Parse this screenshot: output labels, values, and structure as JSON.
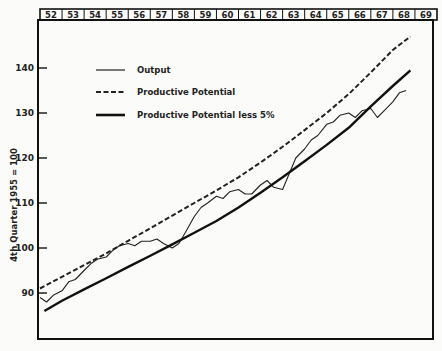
{
  "chart_data": {
    "type": "line",
    "title": "",
    "xlabel": "",
    "ylabel": "4th Quarter 1955 = 100",
    "ylim": [
      82,
      152
    ],
    "yticks": [
      90,
      100,
      110,
      120,
      130,
      140
    ],
    "x_header_years": [
      "52",
      "53",
      "54",
      "55",
      "56",
      "57",
      "58",
      "59",
      "60",
      "61",
      "62",
      "63",
      "64",
      "65",
      "66",
      "67",
      "68",
      "69"
    ],
    "grid": false,
    "legend_position": "upper-left inside",
    "series": [
      {
        "name": "Output",
        "style": "thin solid",
        "x": [
          52.0,
          52.3,
          52.6,
          53.0,
          53.3,
          53.6,
          54.0,
          54.3,
          54.6,
          55.0,
          55.3,
          55.6,
          56.0,
          56.3,
          56.6,
          57.0,
          57.3,
          57.6,
          58.0,
          58.3,
          58.6,
          59.0,
          59.3,
          59.6,
          60.0,
          60.3,
          60.6,
          61.0,
          61.3,
          61.6,
          62.0,
          62.3,
          62.6,
          63.0,
          63.3,
          63.6,
          64.0,
          64.3,
          64.6,
          65.0,
          65.3,
          65.6,
          66.0,
          66.3,
          66.6,
          67.0,
          67.3,
          67.6,
          68.0,
          68.3,
          68.6
        ],
        "values": [
          89.0,
          88.0,
          89.5,
          90.5,
          92.5,
          93.0,
          95.0,
          96.5,
          97.5,
          98.0,
          99.5,
          100.5,
          101.0,
          100.5,
          101.5,
          101.5,
          102.0,
          101.0,
          100.0,
          101.0,
          103.5,
          107.0,
          109.0,
          110.0,
          111.5,
          111.0,
          112.5,
          113.0,
          112.0,
          112.0,
          114.0,
          115.0,
          113.5,
          113.0,
          116.5,
          120.0,
          122.0,
          124.0,
          125.0,
          127.5,
          128.0,
          129.5,
          130.0,
          129.0,
          130.5,
          131.0,
          129.0,
          130.5,
          132.5,
          134.5,
          135.0
        ]
      },
      {
        "name": "Productive Potential",
        "style": "dashed",
        "x": [
          52,
          53,
          54,
          55,
          56,
          57,
          58,
          59,
          60,
          61,
          62,
          63,
          64,
          65,
          66,
          67,
          68,
          68.8
        ],
        "values": [
          91.0,
          93.6,
          96.2,
          98.8,
          101.6,
          104.4,
          107.2,
          110.0,
          112.8,
          115.7,
          119.0,
          122.5,
          126.2,
          130.0,
          134.2,
          139.0,
          144.0,
          147.0
        ]
      },
      {
        "name": "Productive Potential less 5%",
        "style": "thick solid",
        "x": [
          52.2,
          53,
          54,
          55,
          56,
          57,
          58,
          59,
          60,
          61,
          62,
          63,
          64,
          65,
          66,
          67,
          68,
          68.8
        ],
        "values": [
          86.0,
          88.3,
          90.8,
          93.3,
          95.8,
          98.3,
          100.8,
          103.4,
          106.0,
          109.0,
          112.3,
          115.7,
          119.3,
          122.9,
          126.7,
          131.5,
          136.0,
          139.5
        ]
      }
    ]
  },
  "legend": {
    "items": [
      {
        "label": "Output"
      },
      {
        "label": "Productive Potential"
      },
      {
        "label": "Productive Potential less 5%"
      }
    ]
  },
  "axis": {
    "ylabel": "4th Quarter 1955 = 100",
    "yticks": [
      "90",
      "100",
      "110",
      "120",
      "130",
      "140"
    ]
  },
  "header": {
    "years": [
      "52",
      "53",
      "54",
      "55",
      "56",
      "57",
      "58",
      "59",
      "60",
      "61",
      "62",
      "63",
      "64",
      "65",
      "66",
      "67",
      "68",
      "69"
    ]
  }
}
